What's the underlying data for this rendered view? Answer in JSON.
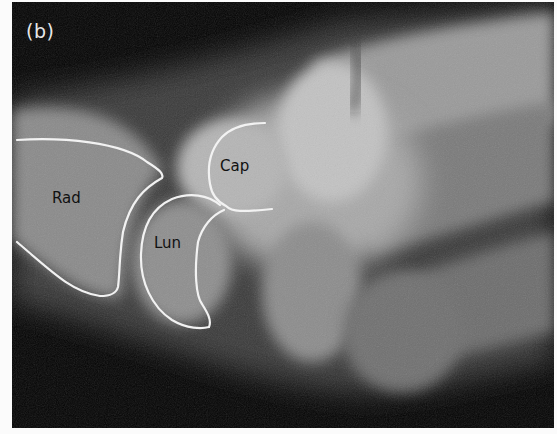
{
  "figure": {
    "panel_label": "(b)",
    "image_type": "wrist lateral radiograph",
    "labels": {
      "radius": "Rad",
      "lunate": "Lun",
      "capitate": "Cap"
    },
    "outline_color": "#f2f2f2",
    "background_color": "#030303"
  }
}
